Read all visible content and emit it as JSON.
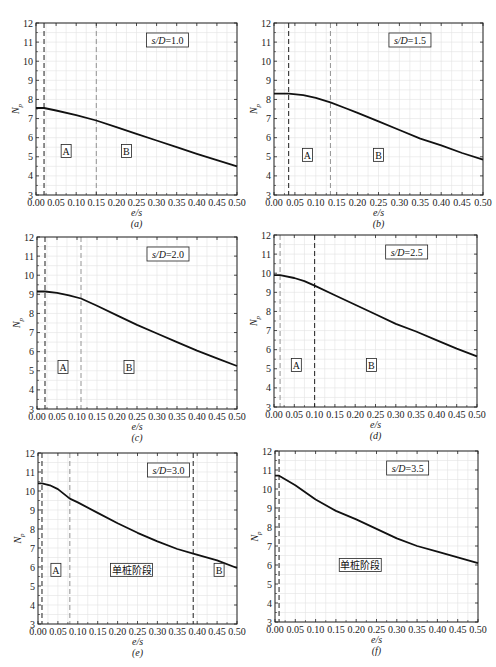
{
  "chart_data": [
    {
      "type": "line",
      "panel": "a",
      "caption": "(a)",
      "title_box": "s/D=1.0",
      "xlabel": "e/s",
      "ylabel": "Np",
      "xlim": [
        0,
        0.5
      ],
      "ylim": [
        3,
        12
      ],
      "xticks": [
        "0.00",
        "0.05",
        "0.10",
        "0.15",
        "0.20",
        "0.25",
        "0.30",
        "0.35",
        "0.40",
        "0.45",
        "0.50"
      ],
      "yticks": [
        "3",
        "4",
        "5",
        "6",
        "7",
        "8",
        "9",
        "10",
        "11",
        "12"
      ],
      "grid": true,
      "x": [
        0.0,
        0.02,
        0.05,
        0.1,
        0.15,
        0.2,
        0.25,
        0.3,
        0.35,
        0.4,
        0.45,
        0.5
      ],
      "y": [
        7.55,
        7.55,
        7.42,
        7.18,
        6.9,
        6.55,
        6.2,
        5.85,
        5.5,
        5.15,
        4.82,
        4.5
      ],
      "vlines": [
        {
          "x": 0.02,
          "style": "dark"
        },
        {
          "x": 0.15,
          "style": "light"
        }
      ],
      "regions": [
        {
          "label": "A",
          "x": 0.075,
          "y": 5.3
        },
        {
          "label": "B",
          "x": 0.225,
          "y": 5.3
        }
      ]
    },
    {
      "type": "line",
      "panel": "b",
      "caption": "(b)",
      "title_box": "s/D=1.5",
      "xlabel": "e/s",
      "ylabel": "Np",
      "xlim": [
        0,
        0.5
      ],
      "ylim": [
        3,
        12
      ],
      "xticks": [
        "0.00",
        "0.05",
        "0.10",
        "0.15",
        "0.20",
        "0.25",
        "0.30",
        "0.35",
        "0.40",
        "0.45",
        "0.50"
      ],
      "yticks": [
        "3",
        "4",
        "5",
        "6",
        "7",
        "8",
        "9",
        "10",
        "11",
        "12"
      ],
      "grid": true,
      "x": [
        0.0,
        0.035,
        0.07,
        0.1,
        0.135,
        0.17,
        0.2,
        0.25,
        0.3,
        0.35,
        0.4,
        0.45,
        0.5
      ],
      "y": [
        8.3,
        8.3,
        8.22,
        8.08,
        7.85,
        7.55,
        7.3,
        6.85,
        6.4,
        5.95,
        5.6,
        5.2,
        4.85
      ],
      "vlines": [
        {
          "x": 0.035,
          "style": "dark"
        },
        {
          "x": 0.135,
          "style": "light"
        }
      ],
      "regions": [
        {
          "label": "A",
          "x": 0.08,
          "y": 5.1
        },
        {
          "label": "B",
          "x": 0.25,
          "y": 5.1
        }
      ]
    },
    {
      "type": "line",
      "panel": "c",
      "caption": "(c)",
      "title_box": "s/D=2.0",
      "xlabel": "e/s",
      "ylabel": "Np",
      "xlim": [
        0,
        0.5
      ],
      "ylim": [
        3,
        12
      ],
      "xticks": [
        "0.00",
        "0.05",
        "0.10",
        "0.15",
        "0.20",
        "0.25",
        "0.30",
        "0.35",
        "0.40",
        "0.45",
        "0.50"
      ],
      "yticks": [
        "3",
        "4",
        "5",
        "6",
        "7",
        "8",
        "9",
        "10",
        "11",
        "12"
      ],
      "grid": true,
      "x": [
        0.0,
        0.02,
        0.05,
        0.08,
        0.11,
        0.15,
        0.2,
        0.25,
        0.3,
        0.35,
        0.4,
        0.45,
        0.5
      ],
      "y": [
        9.15,
        9.15,
        9.08,
        8.95,
        8.78,
        8.4,
        7.9,
        7.4,
        6.95,
        6.5,
        6.05,
        5.65,
        5.25
      ],
      "vlines": [
        {
          "x": 0.02,
          "style": "dark"
        },
        {
          "x": 0.11,
          "style": "light"
        }
      ],
      "regions": [
        {
          "label": "A",
          "x": 0.065,
          "y": 5.2
        },
        {
          "label": "B",
          "x": 0.23,
          "y": 5.2
        }
      ]
    },
    {
      "type": "line",
      "panel": "d",
      "caption": "(d)",
      "title_box": "s/D=2.5",
      "xlabel": "e/s",
      "ylabel": "Np",
      "xlim": [
        0,
        0.5
      ],
      "ylim": [
        3,
        12
      ],
      "xticks": [
        "0.00",
        "0.05",
        "0.10",
        "0.15",
        "0.20",
        "0.25",
        "0.30",
        "0.35",
        "0.40",
        "0.45",
        "0.50"
      ],
      "yticks": [
        "3",
        "4",
        "5",
        "6",
        "7",
        "8",
        "9",
        "10",
        "11",
        "12"
      ],
      "grid": true,
      "x": [
        0.0,
        0.015,
        0.05,
        0.075,
        0.1,
        0.15,
        0.2,
        0.25,
        0.3,
        0.35,
        0.4,
        0.45,
        0.5
      ],
      "y": [
        9.9,
        9.9,
        9.75,
        9.58,
        9.35,
        8.85,
        8.35,
        7.85,
        7.35,
        6.95,
        6.5,
        6.05,
        5.65
      ],
      "vlines": [
        {
          "x": 0.015,
          "style": "light"
        },
        {
          "x": 0.1,
          "style": "dark"
        }
      ],
      "regions": [
        {
          "label": "A",
          "x": 0.055,
          "y": 5.2
        },
        {
          "label": "B",
          "x": 0.24,
          "y": 5.2
        }
      ]
    },
    {
      "type": "line",
      "panel": "e",
      "caption": "(e)",
      "title_box": "s/D=3.0",
      "xlabel": "e/s",
      "ylabel": "Np",
      "xlim": [
        0,
        0.5
      ],
      "ylim": [
        3,
        12
      ],
      "xticks": [
        "0.00",
        "0.05",
        "0.10",
        "0.15",
        "0.20",
        "0.25",
        "0.30",
        "0.35",
        "0.40",
        "0.45",
        "0.50"
      ],
      "yticks": [
        "3",
        "4",
        "5",
        "6",
        "7",
        "8",
        "9",
        "10",
        "11",
        "12"
      ],
      "grid": true,
      "x": [
        0.0,
        0.01,
        0.03,
        0.05,
        0.08,
        0.1,
        0.15,
        0.2,
        0.25,
        0.3,
        0.35,
        0.39,
        0.45,
        0.5
      ],
      "y": [
        10.4,
        10.4,
        10.3,
        10.1,
        9.6,
        9.4,
        8.85,
        8.3,
        7.8,
        7.35,
        6.95,
        6.7,
        6.35,
        5.95
      ],
      "vlines": [
        {
          "x": 0.01,
          "style": "dark"
        },
        {
          "x": 0.08,
          "style": "light"
        },
        {
          "x": 0.39,
          "style": "dark"
        }
      ],
      "regions": [
        {
          "label": "A",
          "x": 0.045,
          "y": 5.85
        },
        {
          "label": "单桩阶段",
          "x": 0.235,
          "y": 5.85
        },
        {
          "label": "B",
          "x": 0.455,
          "y": 5.85
        }
      ]
    },
    {
      "type": "line",
      "panel": "f",
      "caption": "(f)",
      "title_box": "s/D=3.5",
      "xlabel": "e/s",
      "ylabel": "Np",
      "xlim": [
        0,
        0.5
      ],
      "ylim": [
        3,
        12
      ],
      "xticks": [
        "0.00",
        "0.05",
        "0.10",
        "0.15",
        "0.20",
        "0.25",
        "0.30",
        "0.35",
        "0.40",
        "0.45",
        "0.50"
      ],
      "yticks": [
        "3",
        "4",
        "5",
        "6",
        "7",
        "8",
        "9",
        "10",
        "11",
        "12"
      ],
      "grid": true,
      "x": [
        0.0,
        0.01,
        0.05,
        0.1,
        0.15,
        0.2,
        0.25,
        0.3,
        0.35,
        0.4,
        0.45,
        0.5
      ],
      "y": [
        10.7,
        10.7,
        10.2,
        9.45,
        8.85,
        8.4,
        7.9,
        7.4,
        7.0,
        6.7,
        6.4,
        6.1
      ],
      "vlines": [
        {
          "x": 0.01,
          "style": "dark"
        }
      ],
      "regions": [
        {
          "label": "单桩阶段",
          "x": 0.21,
          "y": 6.0
        }
      ]
    }
  ]
}
